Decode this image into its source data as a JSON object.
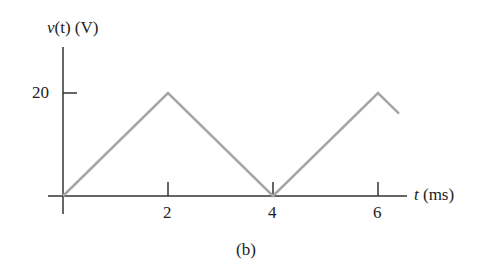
{
  "chart_data": {
    "type": "line",
    "title": "",
    "xlabel": "t (ms)",
    "ylabel": "v(t) (V)",
    "x": [
      0,
      2,
      4,
      6,
      6.4
    ],
    "series": [
      {
        "name": "v(t)",
        "values": [
          0,
          20,
          0,
          20,
          16
        ]
      }
    ],
    "xticks": [
      "2",
      "4",
      "6"
    ],
    "yticks": [
      "20"
    ],
    "xlim": [
      0,
      6.4
    ],
    "ylim": [
      0,
      20
    ],
    "grid": false,
    "legend": "none",
    "caption": "(b)"
  },
  "labels": {
    "ylabel_var": "v",
    "ylabel_rest": "(t) (V)",
    "xlabel_var": "t",
    "xlabel_rest": " (ms)",
    "ytick_20": "20",
    "xtick_2": "2",
    "xtick_4": "4",
    "xtick_6": "6",
    "caption": "(b)"
  },
  "colors": {
    "axis": "#333333",
    "line": "#a6a6a6"
  }
}
